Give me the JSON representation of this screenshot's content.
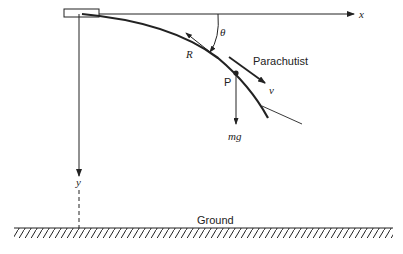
{
  "diagram": {
    "labels": {
      "x_axis": "x",
      "y_axis": "y",
      "angle": "θ",
      "drag": "R",
      "point": "P",
      "subject": "Parachutist",
      "velocity": "v",
      "weight": "mg",
      "ground": "Ground"
    },
    "colors": {
      "stroke": "#222222",
      "background": "#ffffff"
    }
  }
}
